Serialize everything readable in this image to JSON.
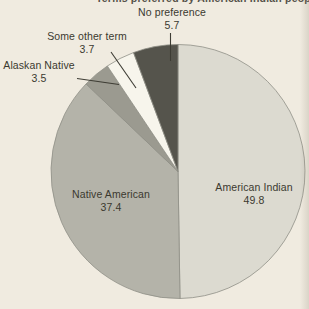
{
  "page": {
    "background_color": "#f0ebe0",
    "cropped_title_fragment": "Terms preferred by American Indian people"
  },
  "chart_data": {
    "type": "pie",
    "title": "",
    "legend": "none",
    "value_labels_shown": true,
    "units": "percent",
    "start_angle_deg": -90,
    "direction": "clockwise",
    "stroke_color": "#8f8f86",
    "stroke_width": 0.8,
    "geometry": {
      "cx": 178,
      "cy": 171.5,
      "r": 127
    },
    "categories": [
      "American Indian",
      "Native American",
      "Alaskan Native",
      "Some other term",
      "No preference"
    ],
    "values": [
      49.8,
      37.4,
      3.5,
      3.7,
      5.7
    ],
    "slices": [
      {
        "label": "American Indian",
        "value": 49.8,
        "value_text": "49.8",
        "color": "#dcdad0"
      },
      {
        "label": "Native American",
        "value": 37.4,
        "value_text": "37.4",
        "color": "#b4b3a9"
      },
      {
        "label": "Alaskan Native",
        "value": 3.5,
        "value_text": "3.5",
        "color": "#9b9a90"
      },
      {
        "label": "Some other term",
        "value": 3.7,
        "value_text": "3.7",
        "color": "#f7f5ec"
      },
      {
        "label": "No preference",
        "value": 5.7,
        "value_text": "5.7",
        "color": "#55544c"
      }
    ]
  }
}
